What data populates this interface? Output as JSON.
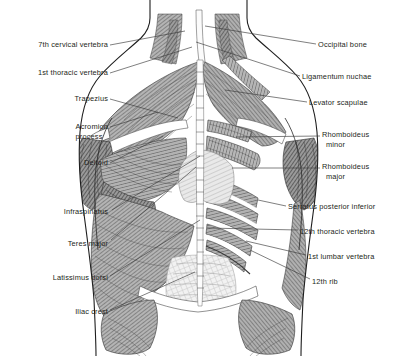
{
  "figure": {
    "view": "posterior",
    "background_color": "#ffffff",
    "text_color": "#231f20",
    "line_color": "#3a3a3a",
    "width": 397,
    "height": 356
  },
  "labels_left": [
    {
      "name": "7th-cervical-vertebra",
      "text": "7th cervical vertebra",
      "text2": "",
      "x": 108,
      "y": 40,
      "leader": [
        [
          110,
          45
        ],
        [
          185,
          31
        ]
      ]
    },
    {
      "name": "1st-thoracic-vertebra",
      "text": "1st thoracic vertebra",
      "text2": "",
      "x": 108,
      "y": 68,
      "leader": [
        [
          110,
          73
        ],
        [
          192,
          47
        ]
      ]
    },
    {
      "name": "trapezius",
      "text": "Trapezius",
      "text2": "",
      "x": 108,
      "y": 94,
      "leader": [
        [
          110,
          99
        ],
        [
          178,
          118
        ]
      ]
    },
    {
      "name": "acromion-process",
      "text": "Acromion",
      "text2": "process",
      "x": 108,
      "y": 122,
      "leader": [
        [
          110,
          127
        ],
        [
          158,
          112
        ]
      ]
    },
    {
      "name": "deltoid",
      "text": "Deltoid",
      "text2": "",
      "x": 108,
      "y": 158,
      "leader": [
        [
          110,
          163
        ],
        [
          163,
          136
        ]
      ]
    },
    {
      "name": "infraspinatus",
      "text": "Infraspinatus",
      "text2": "",
      "x": 108,
      "y": 207,
      "leader": [
        [
          112,
          210
        ],
        [
          200,
          156
        ]
      ]
    },
    {
      "name": "teres-major",
      "text": "Teres major",
      "text2": "",
      "x": 108,
      "y": 239,
      "leader": [
        [
          111,
          240
        ],
        [
          196,
          167
        ]
      ]
    },
    {
      "name": "latissimus-dorsi",
      "text": "Latissimus dorsi",
      "text2": "",
      "x": 108,
      "y": 273,
      "leader": [
        [
          110,
          276
        ],
        [
          200,
          220
        ]
      ]
    },
    {
      "name": "iliac-crest",
      "text": "Iliac crest",
      "text2": "",
      "x": 108,
      "y": 307,
      "leader": [
        [
          110,
          310
        ],
        [
          195,
          272
        ]
      ]
    }
  ],
  "labels_right": [
    {
      "name": "occipital-bone",
      "text": "Occipital bone",
      "text2": "",
      "x": 318,
      "y": 40,
      "leader": [
        [
          316,
          44
        ],
        [
          205,
          26
        ]
      ]
    },
    {
      "name": "ligamentum-nuchae",
      "text": "Ligamentum nuchae",
      "text2": "",
      "x": 302,
      "y": 72,
      "leader": [
        [
          300,
          76
        ],
        [
          196,
          42
        ]
      ]
    },
    {
      "name": "levator-scapulae",
      "text": "Levator scapulae",
      "text2": "",
      "x": 309,
      "y": 98,
      "leader": [
        [
          307,
          102
        ],
        [
          225,
          90
        ]
      ]
    },
    {
      "name": "rhomboideus-minor",
      "text": "Rhomboideus",
      "text2": "minor",
      "x": 322,
      "y": 130,
      "leader": [
        [
          320,
          136
        ],
        [
          236,
          137
        ]
      ]
    },
    {
      "name": "rhomboideus-major",
      "text": "Rhomboideus",
      "text2": "major",
      "x": 322,
      "y": 162,
      "leader": [
        [
          320,
          168
        ],
        [
          232,
          168
        ]
      ]
    },
    {
      "name": "serratus-posterior-inferior",
      "text": "Serratus posterior inferior",
      "text2": "",
      "x": 288,
      "y": 202,
      "leader": [
        [
          286,
          206
        ],
        [
          258,
          200
        ]
      ]
    },
    {
      "name": "12th-thoracic-vertebra",
      "text": "12th thoracic vertebra",
      "text2": "",
      "x": 300,
      "y": 227,
      "leader": [
        [
          298,
          230
        ],
        [
          207,
          228
        ]
      ]
    },
    {
      "name": "1st-lumbar-vertebra",
      "text": "1st lumbar vertebra",
      "text2": "",
      "x": 308,
      "y": 252,
      "leader": [
        [
          306,
          255
        ],
        [
          246,
          241
        ]
      ]
    },
    {
      "name": "12th-rib",
      "text": "12th rib",
      "text2": "",
      "x": 312,
      "y": 277,
      "leader": [
        [
          310,
          279
        ],
        [
          250,
          250
        ]
      ]
    }
  ],
  "anatomy_regions": [
    {
      "name": "neck-trapezius-left",
      "shade": "medium"
    },
    {
      "name": "neck-trapezius-right",
      "shade": "medium"
    },
    {
      "name": "ligamentum-nuchae-band",
      "shade": "light"
    },
    {
      "name": "trapezius-left",
      "shade": "medium"
    },
    {
      "name": "deltoid-left",
      "shade": "dark"
    },
    {
      "name": "infraspinatus-left",
      "shade": "medium"
    },
    {
      "name": "teres-major-left",
      "shade": "dark"
    },
    {
      "name": "latissimus-dorsi-left",
      "shade": "medium"
    },
    {
      "name": "rhomboideus-minor-right",
      "shade": "medium"
    },
    {
      "name": "rhomboideus-major-right",
      "shade": "medium"
    },
    {
      "name": "serratus-posterior-inferior-right",
      "shade": "medium"
    },
    {
      "name": "erector-spinae-center",
      "shade": "light"
    },
    {
      "name": "thoracolumbar-fascia",
      "shade": "light"
    },
    {
      "name": "gluteus-medius-left",
      "shade": "medium"
    },
    {
      "name": "gluteus-medius-right",
      "shade": "medium"
    },
    {
      "name": "spinous-process-column",
      "shade": "light"
    }
  ]
}
